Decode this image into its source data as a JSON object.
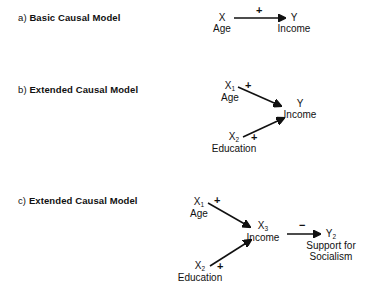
{
  "figure": {
    "background_color": "#ffffff",
    "ink_color": "#111111"
  },
  "panels": [
    {
      "id": "a",
      "prefix": "a)",
      "title": "Basic Causal Model",
      "nodes": [
        {
          "id": "a-x",
          "var": "X",
          "sub": "",
          "name": "Age"
        },
        {
          "id": "a-y",
          "var": "Y",
          "sub": "",
          "name": "Income"
        }
      ],
      "edges": [
        {
          "id": "a-x-to-y",
          "from": "X",
          "to": "Y",
          "sign": "+"
        }
      ]
    },
    {
      "id": "b",
      "prefix": "b)",
      "title": "Extended Causal Model",
      "nodes": [
        {
          "id": "b-x1",
          "var": "X",
          "sub": "1",
          "name": "Age"
        },
        {
          "id": "b-x2",
          "var": "X",
          "sub": "2",
          "name": "Education"
        },
        {
          "id": "b-y",
          "var": "Y",
          "sub": "",
          "name": "Income"
        }
      ],
      "edges": [
        {
          "id": "b-x1-to-y",
          "from": "X1",
          "to": "Y",
          "sign": "+"
        },
        {
          "id": "b-x2-to-y",
          "from": "X2",
          "to": "Y",
          "sign": "+"
        }
      ]
    },
    {
      "id": "c",
      "prefix": "c)",
      "title": "Extended Causal Model",
      "nodes": [
        {
          "id": "c-x1",
          "var": "X",
          "sub": "1",
          "name": "Age"
        },
        {
          "id": "c-x2",
          "var": "X",
          "sub": "2",
          "name": "Education"
        },
        {
          "id": "c-x3",
          "var": "X",
          "sub": "3",
          "name": "Income"
        },
        {
          "id": "c-y2",
          "var": "Y",
          "sub": "2",
          "name_line1": "Support for",
          "name_line2": "Socialism"
        }
      ],
      "edges": [
        {
          "id": "c-x1-to-x3",
          "from": "X1",
          "to": "X3",
          "sign": "+"
        },
        {
          "id": "c-x2-to-x3",
          "from": "X2",
          "to": "X3",
          "sign": "+"
        },
        {
          "id": "c-x3-to-y2",
          "from": "X3",
          "to": "Y2",
          "sign": "−"
        }
      ]
    }
  ],
  "labels": {
    "a_prefix": "a)",
    "a_title": "Basic Causal Model",
    "b_prefix": "b)",
    "b_title": "Extended Causal Model",
    "c_prefix": "c)",
    "c_title": "Extended Causal Model",
    "a_x_var": "X",
    "a_x_name": "Age",
    "a_y_var": "Y",
    "a_y_name": "Income",
    "a_sign": "+",
    "b_x1_var": "X",
    "b_x1_sub": "1",
    "b_x1_name": "Age",
    "b_x2_var": "X",
    "b_x2_sub": "2",
    "b_x2_name": "Education",
    "b_y_var": "Y",
    "b_y_name": "Income",
    "b_sign_top": "+",
    "b_sign_bottom": "+",
    "c_x1_var": "X",
    "c_x1_sub": "1",
    "c_x1_name": "Age",
    "c_x2_var": "X",
    "c_x2_sub": "2",
    "c_x2_name": "Education",
    "c_x3_var": "X",
    "c_x3_sub": "3",
    "c_x3_name": "Income",
    "c_y2_var": "Y",
    "c_y2_sub": "2",
    "c_y2_name_line1": "Support for",
    "c_y2_name_line2": "Socialism",
    "c_sign_top": "+",
    "c_sign_bottom": "+",
    "c_sign_right": "−"
  }
}
